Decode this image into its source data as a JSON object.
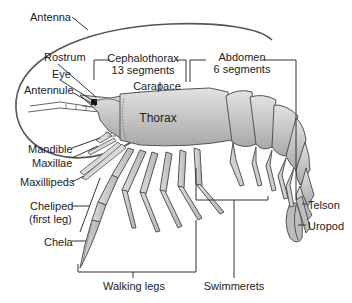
{
  "diagram": {
    "labels": {
      "antenna": "Antenna",
      "rostrum": "Rostrum",
      "eye": "Eye",
      "antennule": "Antennule",
      "cephalothorax": "Cephalothorax",
      "cephalothorax_segments": "13 segments",
      "abdomen": "Abdomen",
      "abdomen_segments": "6 segments",
      "carapace": "Carapace",
      "thorax": "Thorax",
      "mandible": "Mandible",
      "maxillae": "Maxillae",
      "maxillipeds": "Maxillipeds",
      "cheliped": "Cheliped",
      "cheliped_note": "(first leg)",
      "chela": "Chela",
      "walking_legs": "Walking legs",
      "swimmerets": "Swimmerets",
      "telson": "Telson",
      "uropod": "Uropod"
    },
    "colors": {
      "body_fill": "#c9c9c9",
      "body_stroke": "#555555",
      "line": "#333333",
      "text": "#222222",
      "background": "#ffffff"
    }
  }
}
